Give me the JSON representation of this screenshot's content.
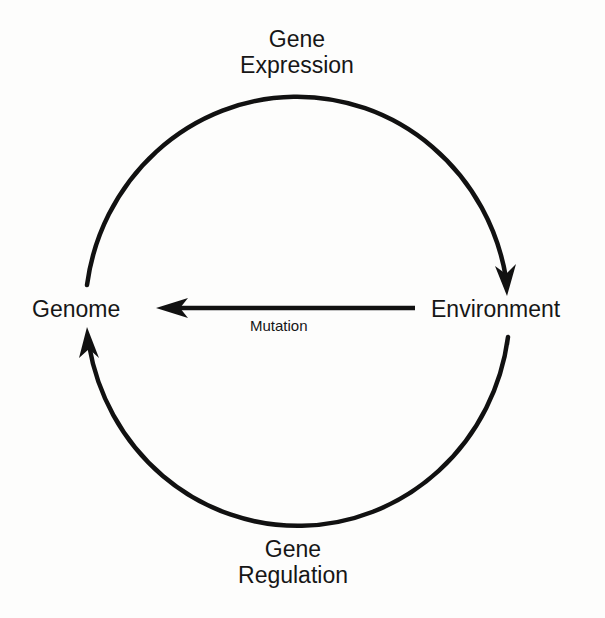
{
  "diagram": {
    "type": "cycle",
    "nodes": {
      "genome": {
        "label": "Genome"
      },
      "environment": {
        "label": "Environment"
      }
    },
    "edges": {
      "gene_expression": {
        "label_line1": "Gene",
        "label_line2": "Expression",
        "from": "Genome",
        "to": "Environment",
        "path": "upper arc"
      },
      "gene_regulation": {
        "label_line1": "Gene",
        "label_line2": "Regulation",
        "from": "Environment",
        "to": "Genome",
        "path": "lower arc"
      },
      "mutation": {
        "label": "Mutation",
        "from": "Environment",
        "to": "Genome",
        "path": "straight horizontal arrow"
      }
    },
    "colors": {
      "stroke": "#111111",
      "text": "#161616",
      "background": "#fdfdfc"
    }
  }
}
